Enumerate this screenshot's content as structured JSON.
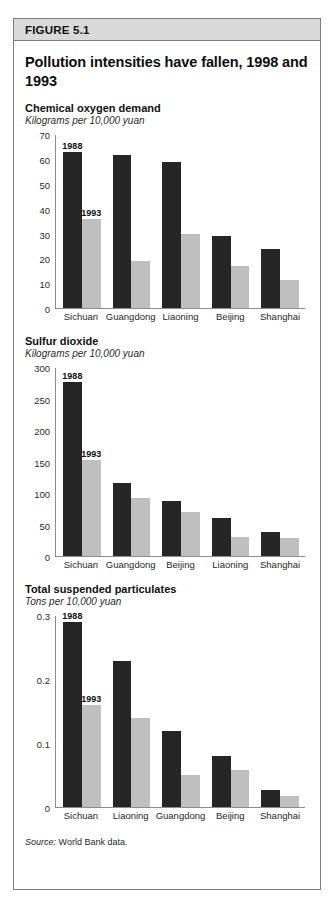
{
  "figure": {
    "header_label": "FIGURE 5.1",
    "title": "Pollution intensities have fallen, 1998 and 1993",
    "source_prefix": "Source:",
    "source_text": "World Bank data.",
    "colors": {
      "series_1988": "#262626",
      "series_1993": "#bfbfbf",
      "header_background": "#d9d9d9",
      "frame_border": "#7d7d7d",
      "axis": "#8c8c8c"
    }
  },
  "chart_data": [
    {
      "type": "bar",
      "title": "Chemical oxygen demand",
      "subtitle": "Kilograms per 10,000 yuan",
      "ylabel": "Kilograms per 10,000 yuan",
      "xlabel": "",
      "ylim": [
        0,
        70
      ],
      "yticks": [
        0,
        10,
        20,
        30,
        40,
        50,
        60,
        70
      ],
      "ytick_labels": [
        "0",
        "10",
        "20",
        "30",
        "40",
        "50",
        "60",
        "70"
      ],
      "grid": false,
      "legend_position": "inline-above-first-bars",
      "categories": [
        "Sichuan",
        "Guangdong",
        "Liaoning",
        "Beijing",
        "Shanghai"
      ],
      "series": [
        {
          "name": "1988",
          "values": [
            63,
            62,
            59,
            29,
            24
          ]
        },
        {
          "name": "1993",
          "values": [
            36,
            19,
            30,
            17,
            11.5
          ]
        }
      ]
    },
    {
      "type": "bar",
      "title": "Sulfur dioxide",
      "subtitle": "Kilograms per 10,000 yuan",
      "ylabel": "Kilograms per 10,000 yuan",
      "xlabel": "",
      "ylim": [
        0,
        300
      ],
      "yticks": [
        0,
        50,
        100,
        150,
        200,
        250,
        300
      ],
      "ytick_labels": [
        "0",
        "50",
        "100",
        "150",
        "200",
        "250",
        "300"
      ],
      "grid": false,
      "legend_position": "inline-above-first-bars",
      "categories": [
        "Sichuan",
        "Guangdong",
        "Beijing",
        "Liaoning",
        "Shanghai"
      ],
      "series": [
        {
          "name": "1988",
          "values": [
            278,
            117,
            88,
            61,
            38
          ]
        },
        {
          "name": "1993",
          "values": [
            153,
            92,
            70,
            30,
            29
          ]
        }
      ]
    },
    {
      "type": "bar",
      "title": "Total suspended particulates",
      "subtitle": "Tons per 10,000 yuan",
      "ylabel": "Tons per 10,000 yuan",
      "xlabel": "",
      "ylim": [
        0,
        0.3
      ],
      "yticks": [
        0,
        0.1,
        0.2,
        0.3
      ],
      "ytick_labels": [
        "0",
        "0.1",
        "0.2",
        "0.3"
      ],
      "grid": false,
      "legend_position": "inline-above-first-bars",
      "categories": [
        "Sichuan",
        "Liaoning",
        "Guangdong",
        "Beijing",
        "Shanghai"
      ],
      "series": [
        {
          "name": "1988",
          "values": [
            0.29,
            0.23,
            0.12,
            0.08,
            0.027
          ]
        },
        {
          "name": "1993",
          "values": [
            0.16,
            0.14,
            0.05,
            0.058,
            0.017
          ]
        }
      ]
    }
  ]
}
